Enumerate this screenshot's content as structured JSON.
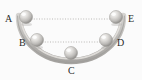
{
  "figure": {
    "background_color": "#fbfbfb",
    "track": {
      "name": "semicircular-bowl-track",
      "shape": "semicircle",
      "stroke_color": "#b7b5b2",
      "highlight_color": "#e2e0dd",
      "shadow_color": "#8f8d8a",
      "thickness_px": 6,
      "center_x": 71,
      "center_y": 18,
      "radius_x": 52,
      "radius_y": 44
    },
    "dotted_lines": [
      {
        "name": "level-line-A-E",
        "from": "A",
        "to": "E",
        "x1": 26,
        "y1": 19,
        "x2": 116,
        "y2": 19,
        "color": "#b9b7b4",
        "style": "dotted"
      },
      {
        "name": "level-line-B-D",
        "from": "B",
        "to": "D",
        "x1": 37,
        "y1": 42,
        "x2": 105,
        "y2": 42,
        "color": "#b9b7b4",
        "style": "dotted"
      }
    ],
    "balls": [
      {
        "label": "A",
        "name": "ball-a",
        "cx": 26,
        "cy": 17,
        "r": 6.5,
        "fill": "#c9c7c4",
        "highlight": "#f2f1ef",
        "shade": "#8e8c89"
      },
      {
        "label": "B",
        "name": "ball-b",
        "cx": 37,
        "cy": 40,
        "r": 6.5,
        "fill": "#c9c7c4",
        "highlight": "#f2f1ef",
        "shade": "#8e8c89"
      },
      {
        "label": "C",
        "name": "ball-c",
        "cx": 71,
        "cy": 53,
        "r": 6.5,
        "fill": "#c9c7c4",
        "highlight": "#f2f1ef",
        "shade": "#8e8c89"
      },
      {
        "label": "D",
        "name": "ball-d",
        "cx": 106,
        "cy": 40,
        "r": 6.5,
        "fill": "#c9c7c4",
        "highlight": "#f2f1ef",
        "shade": "#8e8c89"
      },
      {
        "label": "E",
        "name": "ball-e",
        "cx": 116,
        "cy": 17,
        "r": 6.5,
        "fill": "#c9c7c4",
        "highlight": "#f2f1ef",
        "shade": "#8e8c89"
      }
    ],
    "labels": {
      "a": "A",
      "b": "B",
      "c": "C",
      "d": "D",
      "e": "E"
    }
  }
}
